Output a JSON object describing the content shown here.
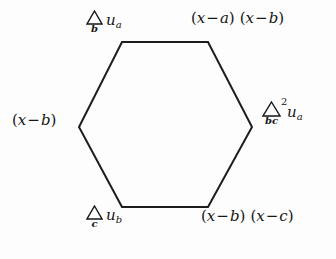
{
  "figure": {
    "type": "hexagon-difference-diagram",
    "background_color": "#fdfdfd",
    "line_color": "#1d1d1d",
    "line_width": 2,
    "hexagon": {
      "vertices": [
        {
          "name": "top-left",
          "x": 122,
          "y": 42
        },
        {
          "name": "top-right",
          "x": 208,
          "y": 42
        },
        {
          "name": "right",
          "x": 252,
          "y": 127
        },
        {
          "name": "bottom-right",
          "x": 208,
          "y": 207
        },
        {
          "name": "bottom-left",
          "x": 122,
          "y": 207
        },
        {
          "name": "left",
          "x": 79,
          "y": 127
        }
      ],
      "points_string": "122,42 208,42 252,127 208,207 122,207 79,127"
    },
    "labels": {
      "top_left": {
        "id": "delta-b-u-a",
        "operator": "Δ",
        "operator_subscript": "b",
        "operator_superscript": "",
        "operand": "u",
        "operand_subscript": "a",
        "text": "Δ_b u_a"
      },
      "top_right": {
        "id": "x-minus-a-x-minus-b",
        "factor_one": {
          "open": "(",
          "var": "x",
          "op": "−",
          "term": "a",
          "close": ")"
        },
        "factor_two": {
          "open": "(",
          "var": "x",
          "op": "−",
          "term": "b",
          "close": ")"
        },
        "text": "(x − a) (x − b)"
      },
      "left": {
        "id": "x-minus-b",
        "factor_one": {
          "open": "(",
          "var": "x",
          "op": "−",
          "term": "b",
          "close": ")"
        },
        "text": "(x − b)"
      },
      "right": {
        "id": "delta-2-bc-u-a",
        "operator": "Δ",
        "operator_subscript": "bc",
        "operator_superscript": "2",
        "operand": "u",
        "operand_subscript": "a",
        "text": "Δ²_bc u_a"
      },
      "bottom_left": {
        "id": "delta-c-u-b",
        "operator": "Δ",
        "operator_subscript": "c",
        "operator_superscript": "",
        "operand": "u",
        "operand_subscript": "b",
        "text": "Δ_c u_b"
      },
      "bottom_right": {
        "id": "x-minus-b-x-minus-c",
        "factor_one": {
          "open": "(",
          "var": "x",
          "op": "−",
          "term": "b",
          "close": ")"
        },
        "factor_two": {
          "open": "(",
          "var": "x",
          "op": "−",
          "term": "c",
          "close": ")"
        },
        "text": "(x − b) (x − c)"
      }
    }
  }
}
